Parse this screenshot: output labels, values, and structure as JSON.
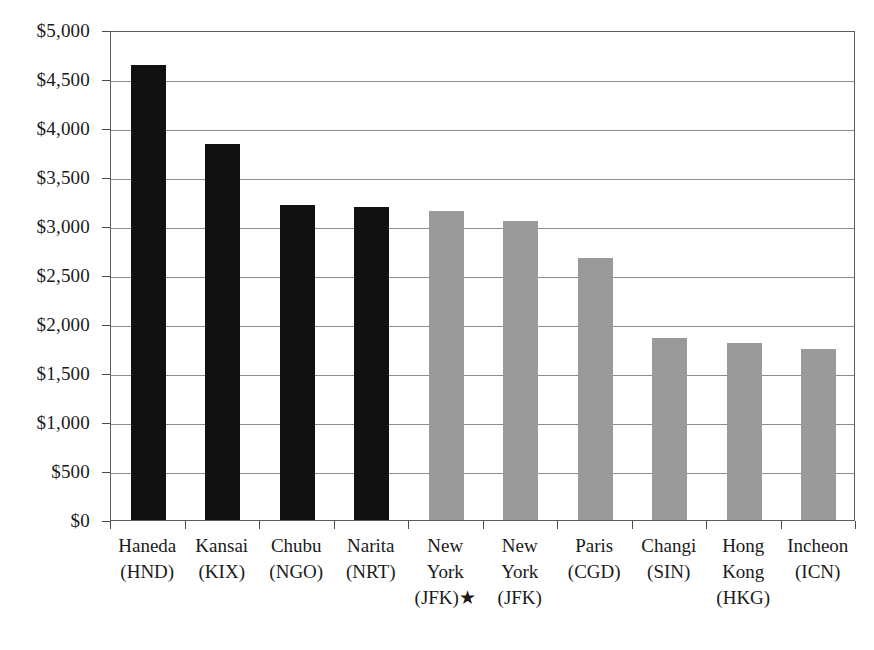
{
  "chart_data": {
    "type": "bar",
    "title": "",
    "subtitle": "",
    "xlabel": "",
    "ylabel": "",
    "ylim": [
      0,
      5000
    ],
    "ytick_step": 500,
    "grid": true,
    "legend": "none",
    "currency_prefix": "$",
    "categories": [
      "Haneda (HND)",
      "Kansai (KIX)",
      "Chubu (NGO)",
      "Narita (NRT)",
      "New York (JFK)★",
      "New York (JFK)",
      "Paris (CGD)",
      "Changi (SIN)",
      "Hong Kong (HKG)",
      "Incheon (ICN)"
    ],
    "category_lines": [
      [
        "Haneda",
        "(HND)"
      ],
      [
        "Kansai",
        "(KIX)"
      ],
      [
        "Chubu",
        "(NGO)"
      ],
      [
        "Narita",
        "(NRT)"
      ],
      [
        "New",
        "York",
        "(JFK)★"
      ],
      [
        "New",
        "York",
        "(JFK)"
      ],
      [
        "Paris",
        "(CGD)"
      ],
      [
        "Changi",
        "(SIN)"
      ],
      [
        "Hong",
        "Kong",
        "(HKG)"
      ],
      [
        "Incheon",
        "(ICN)"
      ]
    ],
    "values": [
      4640,
      3840,
      3210,
      3190,
      3150,
      3055,
      2670,
      1860,
      1805,
      1740
    ],
    "bar_colors": [
      "#111111",
      "#111111",
      "#111111",
      "#111111",
      "#9a9a9a",
      "#9a9a9a",
      "#9a9a9a",
      "#9a9a9a",
      "#9a9a9a",
      "#9a9a9a"
    ],
    "ytick_labels": [
      "$0",
      "$500",
      "$1,000",
      "$1,500",
      "$2,000",
      "$2,500",
      "$3,000",
      "$3,500",
      "$4,000",
      "$4,500",
      "$5,000"
    ],
    "ytick_values": [
      0,
      500,
      1000,
      1500,
      2000,
      2500,
      3000,
      3500,
      4000,
      4500,
      5000
    ]
  },
  "colors": {
    "series_primary": "#111111",
    "series_secondary": "#9a9a9a",
    "gridline": "#8d8d8d",
    "axis": "#5c5c5c",
    "text": "#1a1a1a",
    "background": "#ffffff"
  }
}
